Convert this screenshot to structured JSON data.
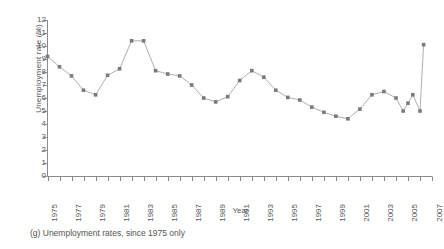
{
  "caption": "(g) Unemployment rates, since 1975 only",
  "chart_data": {
    "type": "line",
    "title": "",
    "xlabel": "Year",
    "ylabel": "Unemployment rate (%)",
    "xlim": [
      1975,
      2007
    ],
    "ylim": [
      0,
      12
    ],
    "grid": false,
    "legend": "none",
    "marker": "square",
    "marker_color": "#7a7a7a",
    "line_color": "#9a9a9a",
    "y_ticks": [
      0,
      1,
      2,
      3,
      4,
      5,
      6,
      7,
      8,
      9,
      10,
      11,
      12
    ],
    "x_ticks": [
      1975,
      1977,
      1979,
      1981,
      1983,
      1985,
      1987,
      1989,
      1991,
      1993,
      1995,
      1997,
      1999,
      2001,
      2003,
      2005,
      2007
    ],
    "x_tick_labels": [
      "1975",
      "1977",
      "1979",
      "1981",
      "1983",
      "1985",
      "1987",
      "1989",
      "1991",
      "1993",
      "1995",
      "1997",
      "1999",
      "2001",
      "2003",
      "2005",
      "2007"
    ],
    "x": [
      1975,
      1976,
      1977,
      1978,
      1979,
      1980,
      1981,
      1982,
      1983,
      1984,
      1985,
      1986,
      1987,
      1988,
      1989,
      1990,
      1991,
      1992,
      1993,
      1994,
      1995,
      1996,
      1997,
      1998,
      1999,
      2000,
      2001,
      2002,
      2003,
      2004,
      2005,
      2006
    ],
    "values": [
      9.2,
      8.4,
      7.7,
      6.6,
      6.25,
      7.75,
      8.25,
      10.4,
      10.4,
      8.1,
      7.85,
      7.7,
      7.0,
      6.0,
      5.7,
      6.1,
      7.35,
      8.1,
      7.6,
      6.6,
      6.05,
      5.85,
      5.3,
      4.9,
      4.6,
      4.4,
      5.15,
      6.25,
      6.5,
      6.0,
      5.6,
      5.0
    ],
    "extra_points": [
      {
        "x": 2004.6,
        "y": 5.0
      },
      {
        "x": 2005.4,
        "y": 6.25
      },
      {
        "x": 2006.3,
        "y": 10.1
      }
    ]
  }
}
